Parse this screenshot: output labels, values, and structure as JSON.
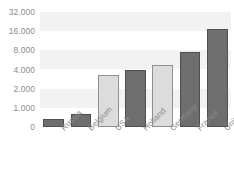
{
  "chart_data": {
    "type": "bar",
    "title": "",
    "subtitle": "",
    "xlabel": "",
    "ylabel": "",
    "categories": [
      "Russia",
      "Belgium",
      "USA",
      "Holland",
      "Germany",
      "France",
      "United Kingdom"
    ],
    "values": [
      400,
      700,
      3400,
      4000,
      5000,
      7700,
      18000
    ],
    "value_labels": [
      "400",
      "700",
      "3.400",
      "4.000",
      "5.000",
      "7.700",
      "18.000"
    ],
    "ytick_labels": [
      "0",
      "1.000",
      "2.000",
      "4.000",
      "8.000",
      "16.000",
      "32.000"
    ],
    "ytick_values": [
      0,
      1000,
      2000,
      4000,
      8000,
      16000,
      32000
    ],
    "ylim": [
      0,
      32000
    ],
    "yscale": "log-like-stepped",
    "grid": false,
    "background_bands": true,
    "legend": "none",
    "bar_colors": [
      "#6e6e6e",
      "#6e6e6e",
      "#dcdcdc",
      "#6e6e6e",
      "#dcdcdc",
      "#6e6e6e",
      "#6e6e6e"
    ],
    "bar_border_colors": [
      "#4f4f4f",
      "#4f4f4f",
      "#8f8f8f",
      "#4f4f4f",
      "#8f8f8f",
      "#4f4f4f",
      "#4f4f4f"
    ]
  },
  "style": {
    "axis_text_color": "#8b8b8b",
    "plot_background": "#ffffff",
    "band_color": "#f2f2f2",
    "page_background": "#ffffff"
  }
}
